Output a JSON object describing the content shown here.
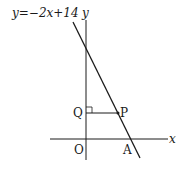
{
  "diagram": {
    "equation_label": "y=−2x+14",
    "axis_labels": {
      "x": "x",
      "y": "y"
    },
    "points": {
      "origin": "O",
      "Q": "Q",
      "P": "P",
      "A": "A"
    },
    "colors": {
      "stroke": "#1a1a1a",
      "background": "#ffffff"
    }
  }
}
